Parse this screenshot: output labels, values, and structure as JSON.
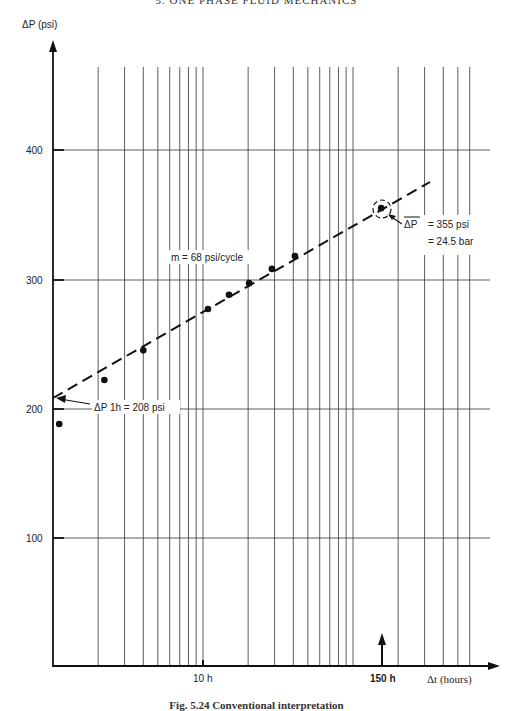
{
  "header": "5. ONE PHASE FLUID MECHANICS",
  "caption": "Fig. 5.24  Conventional interpretation",
  "chart_data": {
    "type": "scatter",
    "title": "",
    "xlabel": "Δt (hours)",
    "ylabel": "ΔP (psi)",
    "x_scale": "log",
    "x_range_hours": [
      1,
      1000
    ],
    "ylim": [
      0,
      450
    ],
    "y_ticks": [
      100,
      200,
      300,
      400
    ],
    "x_tick_labels": [
      {
        "value": 10,
        "label": "10 h"
      },
      {
        "value": 150,
        "label": "150 h"
      }
    ],
    "grid": true,
    "series": [
      {
        "name": "measured points",
        "x": [
          1.1,
          2.2,
          4.0,
          10.8,
          14.9,
          20.3,
          28.8,
          41,
          154
        ],
        "y": [
          188,
          222,
          245,
          277,
          288,
          297,
          308,
          318,
          355
        ]
      },
      {
        "name": "semi-log straight line (dashed)",
        "x": [
          1,
          200
        ],
        "y": [
          208,
          364
        ]
      }
    ],
    "annotations": [
      {
        "text": "m = 68 psi/cycle"
      },
      {
        "text": "ΔP 1h = 208 psi"
      },
      {
        "text": "ΔP = 355 psi",
        "overline": "ΔP"
      },
      {
        "text": "= 24.5 bar"
      },
      {
        "text": "150 h",
        "arrow": "up"
      }
    ]
  },
  "labels": {
    "y_axis": "ΔP (psi)",
    "x_axis": "Δt (hours)",
    "y400": "400",
    "y300": "300",
    "y200": "200",
    "y100": "100",
    "x10": "10 h",
    "x150": "150 h",
    "slope": "m = 68 psi/cycle",
    "p1h": "ΔP 1h = 208 psi",
    "pbar_sym": "ΔP",
    "pbar_psi": "= 355 psi",
    "pbar_bar": "= 24.5 bar"
  }
}
